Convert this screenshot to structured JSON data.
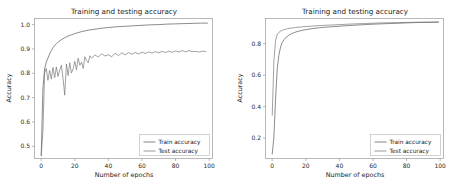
{
  "chart_data": [
    {
      "id": "left",
      "type": "line",
      "title": "Training and testing accuracy",
      "xlabel": "Number of epochs",
      "ylabel": "Accuracy",
      "xlim": [
        -4,
        102
      ],
      "ylim": [
        0.45,
        1.025
      ],
      "xticks": [
        0,
        20,
        40,
        60,
        80,
        100
      ],
      "yticks": [
        0.5,
        0.6,
        0.7,
        0.8,
        0.9,
        1.0
      ],
      "xtick_labels": [
        "0",
        "20",
        "40",
        "60",
        "80",
        "100"
      ],
      "ytick_labels": [
        "0.5",
        "0.6",
        "0.7",
        "0.8",
        "0.9",
        "1.0"
      ],
      "grid": false,
      "legend_position": "lower right",
      "legend": [
        "Train accuracy",
        "Test accuracy"
      ],
      "colors": {
        "train": "#4d4d4d",
        "test": "#6e6e6e"
      },
      "series": [
        {
          "name": "Train accuracy",
          "x": [
            0,
            1,
            2,
            3,
            4,
            5,
            6,
            7,
            8,
            9,
            10,
            12,
            14,
            16,
            18,
            20,
            24,
            28,
            32,
            36,
            40,
            45,
            50,
            55,
            60,
            65,
            70,
            75,
            80,
            85,
            90,
            95,
            99
          ],
          "values": [
            0.462,
            0.735,
            0.818,
            0.845,
            0.862,
            0.879,
            0.893,
            0.905,
            0.914,
            0.921,
            0.928,
            0.938,
            0.946,
            0.953,
            0.958,
            0.963,
            0.971,
            0.977,
            0.981,
            0.985,
            0.988,
            0.991,
            0.993,
            0.995,
            0.997,
            0.999,
            1.0,
            1.002,
            1.003,
            1.004,
            1.005,
            1.006,
            1.006
          ]
        },
        {
          "name": "Test accuracy",
          "x": [
            0,
            1,
            2,
            3,
            4,
            5,
            6,
            7,
            8,
            9,
            10,
            11,
            12,
            13,
            14,
            15,
            16,
            17,
            18,
            19,
            20,
            21,
            22,
            23,
            24,
            25,
            26,
            27,
            28,
            29,
            30,
            32,
            34,
            36,
            38,
            40,
            42,
            44,
            46,
            48,
            50,
            52,
            54,
            56,
            58,
            60,
            62,
            64,
            66,
            68,
            70,
            72,
            74,
            76,
            78,
            80,
            82,
            84,
            86,
            88,
            90,
            92,
            94,
            96,
            98
          ],
          "values": [
            0.462,
            0.562,
            0.8,
            0.82,
            0.771,
            0.812,
            0.776,
            0.824,
            0.782,
            0.826,
            0.787,
            0.812,
            0.833,
            0.778,
            0.71,
            0.838,
            0.791,
            0.843,
            0.801,
            0.818,
            0.849,
            0.814,
            0.862,
            0.833,
            0.846,
            0.82,
            0.868,
            0.852,
            0.843,
            0.872,
            0.862,
            0.875,
            0.867,
            0.88,
            0.871,
            0.876,
            0.868,
            0.882,
            0.873,
            0.884,
            0.876,
            0.885,
            0.878,
            0.886,
            0.879,
            0.887,
            0.881,
            0.888,
            0.883,
            0.889,
            0.884,
            0.89,
            0.885,
            0.891,
            0.886,
            0.892,
            0.887,
            0.893,
            0.888,
            0.893,
            0.889,
            0.89,
            0.887,
            0.891,
            0.889
          ]
        }
      ]
    },
    {
      "id": "right",
      "type": "line",
      "title": "Training and testing accuracy",
      "xlabel": "Number of epochs",
      "ylabel": "Accuracy",
      "xlim": [
        -4,
        102
      ],
      "ylim": [
        0.07,
        0.96
      ],
      "xticks": [
        0,
        20,
        40,
        60,
        80,
        100
      ],
      "yticks": [
        0.2,
        0.4,
        0.6,
        0.8
      ],
      "xtick_labels": [
        "0",
        "20",
        "40",
        "60",
        "80",
        "100"
      ],
      "ytick_labels": [
        "0.2",
        "0.4",
        "0.6",
        "0.8"
      ],
      "grid": false,
      "legend_position": "lower right",
      "legend": [
        "Train accuracy",
        "Test accuracy"
      ],
      "colors": {
        "train": "#4d4d4d",
        "test": "#6e6e6e"
      },
      "series": [
        {
          "name": "Train accuracy",
          "x": [
            0,
            1,
            2,
            3,
            4,
            5,
            6,
            7,
            8,
            10,
            12,
            14,
            16,
            18,
            20,
            24,
            28,
            32,
            36,
            40,
            45,
            50,
            55,
            60,
            65,
            70,
            75,
            80,
            85,
            90,
            95,
            99
          ],
          "values": [
            0.098,
            0.205,
            0.455,
            0.64,
            0.73,
            0.78,
            0.808,
            0.825,
            0.838,
            0.855,
            0.866,
            0.874,
            0.88,
            0.885,
            0.889,
            0.896,
            0.901,
            0.905,
            0.908,
            0.911,
            0.915,
            0.918,
            0.921,
            0.924,
            0.926,
            0.928,
            0.93,
            0.932,
            0.934,
            0.935,
            0.936,
            0.937
          ]
        },
        {
          "name": "Test accuracy",
          "x": [
            0,
            1,
            2,
            3,
            4,
            5,
            6,
            7,
            8,
            10,
            12,
            14,
            16,
            18,
            20,
            24,
            28,
            32,
            36,
            40,
            45,
            50,
            55,
            60,
            65,
            70,
            75,
            80,
            85,
            90,
            95,
            99
          ],
          "values": [
            0.345,
            0.69,
            0.82,
            0.858,
            0.872,
            0.88,
            0.885,
            0.889,
            0.892,
            0.897,
            0.9,
            0.903,
            0.905,
            0.907,
            0.909,
            0.912,
            0.915,
            0.917,
            0.919,
            0.921,
            0.924,
            0.926,
            0.928,
            0.93,
            0.932,
            0.933,
            0.934,
            0.935,
            0.936,
            0.937,
            0.937,
            0.938
          ]
        }
      ]
    }
  ]
}
